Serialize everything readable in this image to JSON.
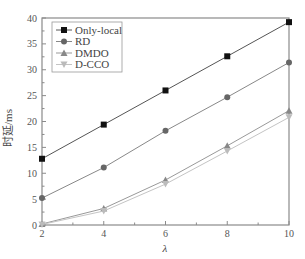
{
  "chart_data": {
    "type": "line",
    "title": "",
    "xlabel": "λ",
    "ylabel": "时延/ms",
    "x": [
      2,
      4,
      6,
      8,
      10
    ],
    "xlim": [
      2,
      10
    ],
    "ylim": [
      0,
      40
    ],
    "xticks": [
      2,
      4,
      6,
      8,
      10
    ],
    "yticks": [
      0,
      5,
      10,
      15,
      20,
      25,
      30,
      35,
      40
    ],
    "grid": false,
    "legend_position": "upper left",
    "series": [
      {
        "name": "Only-local",
        "marker": "square",
        "color": "#111111",
        "line_color": "#555555",
        "values": [
          12.8,
          19.4,
          26.0,
          32.6,
          39.2
        ]
      },
      {
        "name": "RD",
        "marker": "circle",
        "color": "#666666",
        "line_color": "#888888",
        "values": [
          5.2,
          11.1,
          18.2,
          24.7,
          31.4
        ]
      },
      {
        "name": "DMDO",
        "marker": "triangle-up",
        "color": "#888888",
        "line_color": "#999999",
        "values": [
          0.2,
          3.2,
          8.7,
          15.3,
          22.1
        ]
      },
      {
        "name": "D-CCO",
        "marker": "triangle-down",
        "color": "#bbbbbb",
        "line_color": "#c4c4c4",
        "values": [
          0.1,
          2.7,
          7.9,
          14.3,
          20.8
        ]
      }
    ]
  }
}
